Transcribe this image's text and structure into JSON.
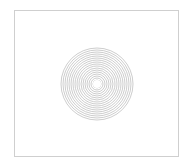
{
  "figure": {
    "title": "",
    "background_color": "#ffffff",
    "frame": {
      "border_color": "#cfcfcf",
      "fill_color": "#ffffff",
      "x": 14,
      "y": 10,
      "width": 165,
      "height": 147
    }
  },
  "chart_data": {
    "type": "line",
    "title": "",
    "subtitle": "",
    "xlabel": "",
    "ylabel": "",
    "legend": [],
    "annotations": [],
    "grid": false,
    "axis_ticks_visible": false,
    "tick_labels_x": [],
    "tick_labels_y": [],
    "xlim": [
      -40,
      40
    ],
    "ylim": [
      -40,
      40
    ],
    "pattern": "concentric-circles",
    "center_x": 82,
    "center_y": 73,
    "ring_count": 18,
    "ring_spacing": 2,
    "inner_radius": 4,
    "outer_radius": 36,
    "stroke_color": "#b8b8b8",
    "stroke_width": 0.7,
    "center_hole_radius": 4,
    "center_hole_color": "#ffffff",
    "radii": [
      4,
      6,
      8,
      10,
      12,
      14,
      16,
      18,
      20,
      22,
      24,
      26,
      28,
      30,
      32,
      34,
      36
    ]
  }
}
